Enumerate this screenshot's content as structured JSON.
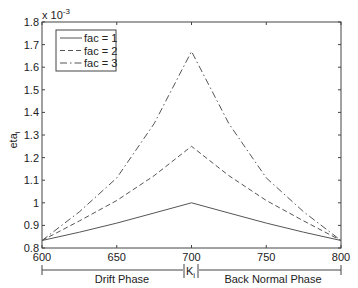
{
  "chart_data": {
    "type": "line",
    "title": "",
    "xlabel": "",
    "ylabel": "eta_i",
    "ylabel_main": "eta",
    "ylabel_sub": "i",
    "y_multiplier": "x 10",
    "y_multiplier_exp": "-3",
    "xlim": [
      600,
      800
    ],
    "ylim": [
      0.8,
      1.8
    ],
    "xticks": [
      600,
      650,
      700,
      750,
      800
    ],
    "xtick_labels": [
      "600",
      "650",
      "700",
      "750",
      "800"
    ],
    "yticks": [
      0.8,
      0.9,
      1.0,
      1.1,
      1.2,
      1.3,
      1.4,
      1.5,
      1.6,
      1.7,
      1.8
    ],
    "ytick_labels": [
      "0.8",
      "0.9",
      "1",
      "1.1",
      "1.2",
      "1.3",
      "1.4",
      "1.5",
      "1.6",
      "1.7",
      "1.8"
    ],
    "grid": false,
    "legend_position": "upper left",
    "x": [
      600,
      625,
      650,
      675,
      700,
      725,
      750,
      775,
      800
    ],
    "series": [
      {
        "name": "fac = 1",
        "style": "solid",
        "values": [
          0.833,
          0.87,
          0.91,
          0.955,
          1.0,
          0.955,
          0.91,
          0.87,
          0.833
        ]
      },
      {
        "name": "fac = 2",
        "style": "dashed",
        "values": [
          0.833,
          0.92,
          1.01,
          1.12,
          1.25,
          1.12,
          1.01,
          0.92,
          0.833
        ]
      },
      {
        "name": "fac = 3",
        "style": "dashdot",
        "values": [
          0.833,
          0.96,
          1.11,
          1.35,
          1.67,
          1.35,
          1.11,
          0.96,
          0.833
        ]
      }
    ],
    "annotations": {
      "phase_left": "Drift Phase",
      "phase_right": "Back Normal Phase",
      "marker_main": "K",
      "marker_sub": "i"
    }
  }
}
